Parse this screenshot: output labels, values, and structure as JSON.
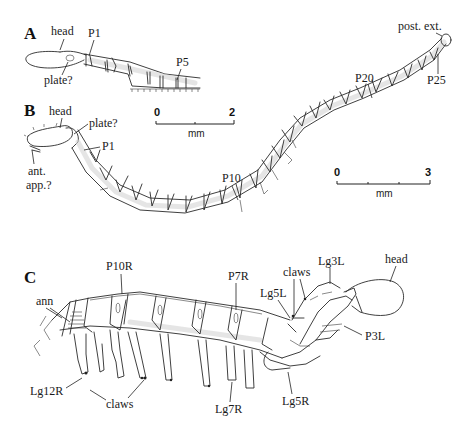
{
  "figure": {
    "panels": [
      {
        "id": "A",
        "letter": "A",
        "labels": {
          "head": "head",
          "p1": "P1",
          "plate": "plate?",
          "p5": "P5"
        }
      },
      {
        "id": "B",
        "letter": "B",
        "labels": {
          "head": "head",
          "plate": "plate?",
          "p1": "P1",
          "ant_app_line1": "ant.",
          "ant_app_line2": "app.?",
          "p10": "P10",
          "p20": "P20",
          "p25": "P25",
          "post_ext": "post. ext."
        },
        "scale_bars": [
          {
            "start": "0",
            "end": "2",
            "unit": "mm",
            "ticks": 3
          },
          {
            "start": "0",
            "end": "3",
            "unit": "mm",
            "ticks": 4
          }
        ]
      },
      {
        "id": "C",
        "letter": "C",
        "labels": {
          "ann": "ann",
          "p10r": "P10R",
          "p7r": "P7R",
          "claws_top": "claws",
          "lg3l": "Lg3L",
          "head": "head",
          "lg5l": "Lg5L",
          "p3l": "P3L",
          "lg12r": "Lg12R",
          "claws_bottom": "claws",
          "lg7r": "Lg7R",
          "lg5r": "Lg5R"
        }
      }
    ]
  }
}
